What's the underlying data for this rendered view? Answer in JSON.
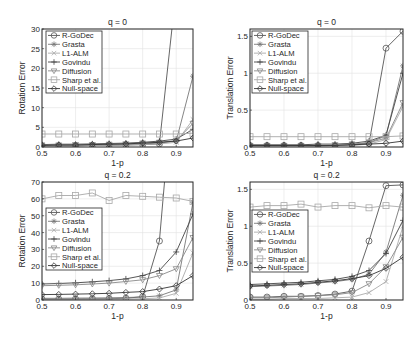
{
  "figure": {
    "width": 419,
    "height": 338,
    "colors": {
      "axis": "#262626",
      "grid": "#e3e3e3",
      "legend_border": "#262626"
    }
  },
  "legend_entries": [
    {
      "name": "R-GoDec",
      "marker": "circle",
      "color": "#555555"
    },
    {
      "name": "Grasta",
      "marker": "asterisk",
      "color": "#777777"
    },
    {
      "name": "L1-ALM",
      "marker": "x",
      "color": "#aaaaaa"
    },
    {
      "name": "Govindu",
      "marker": "plus",
      "color": "#444444"
    },
    {
      "name": "Diffusion",
      "marker": "triangle-down",
      "color": "#888888"
    },
    {
      "name": "Sharp et al.",
      "marker": "square",
      "color": "#a8a8a8"
    },
    {
      "name": "Null-space",
      "marker": "diamond",
      "color": "#333333"
    }
  ],
  "chart_data": [
    {
      "type": "line",
      "title": "q = 0",
      "xlabel": "1-p",
      "ylabel": "Rotation Error",
      "xlim": [
        0.5,
        0.95
      ],
      "ylim": [
        0,
        30
      ],
      "xticks": [
        0.5,
        0.6,
        0.7,
        0.8,
        0.9
      ],
      "yticks": [
        0,
        5,
        10,
        15,
        20,
        25,
        30
      ],
      "grid": true,
      "legend_position": "upper left",
      "box": {
        "x": 42,
        "y": 29,
        "w": 151,
        "h": 118
      },
      "legend_box": {
        "x": 46,
        "y": 31,
        "w": 56,
        "h": 62
      },
      "x": [
        0.5,
        0.55,
        0.6,
        0.65,
        0.7,
        0.75,
        0.8,
        0.85,
        0.9,
        0.95
      ],
      "series": [
        {
          "name": "R-GoDec",
          "values": [
            0.3,
            0.3,
            0.3,
            0.4,
            0.4,
            0.5,
            0.6,
            0.8,
            40,
            200
          ]
        },
        {
          "name": "Grasta",
          "values": [
            0.4,
            0.4,
            0.5,
            0.5,
            0.6,
            0.7,
            0.8,
            1.0,
            1.5,
            18
          ]
        },
        {
          "name": "L1-ALM",
          "values": [
            0.3,
            0.3,
            0.3,
            0.4,
            0.4,
            0.5,
            0.6,
            0.8,
            1.2,
            7
          ]
        },
        {
          "name": "Govindu",
          "values": [
            0.6,
            0.7,
            0.7,
            0.8,
            0.9,
            1.0,
            1.2,
            1.5,
            2.0,
            4.5
          ]
        },
        {
          "name": "Diffusion",
          "values": [
            0.5,
            0.5,
            0.6,
            0.6,
            0.7,
            0.8,
            1.0,
            1.2,
            1.6,
            6
          ]
        },
        {
          "name": "Sharp et al.",
          "values": [
            3.3,
            3.3,
            3.3,
            3.3,
            3.3,
            3.3,
            3.3,
            3.3,
            3.3,
            3.5
          ]
        },
        {
          "name": "Null-space",
          "values": [
            0.4,
            0.5,
            0.5,
            0.6,
            0.7,
            0.8,
            1.0,
            1.2,
            1.5,
            2.3
          ]
        }
      ]
    },
    {
      "type": "line",
      "title": "q = 0",
      "xlabel": "1-p",
      "ylabel": "Translation Error",
      "xlim": [
        0.5,
        0.95
      ],
      "ylim": [
        0,
        1.6
      ],
      "xticks": [
        0.5,
        0.6,
        0.7,
        0.8,
        0.9
      ],
      "yticks": [
        0,
        0.5,
        1,
        1.5
      ],
      "grid": true,
      "legend_position": "upper left",
      "box": {
        "x": 250,
        "y": 29,
        "w": 153,
        "h": 118
      },
      "legend_box": {
        "x": 252,
        "y": 31,
        "w": 56,
        "h": 62
      },
      "x": [
        0.5,
        0.55,
        0.6,
        0.65,
        0.7,
        0.75,
        0.8,
        0.85,
        0.9,
        0.95
      ],
      "series": [
        {
          "name": "R-GoDec",
          "values": [
            0.02,
            0.02,
            0.02,
            0.02,
            0.02,
            0.02,
            0.03,
            0.05,
            1.34,
            1.57
          ]
        },
        {
          "name": "Grasta",
          "values": [
            0.02,
            0.02,
            0.02,
            0.02,
            0.02,
            0.02,
            0.03,
            0.06,
            0.15,
            1.1
          ]
        },
        {
          "name": "L1-ALM",
          "values": [
            0.01,
            0.01,
            0.01,
            0.01,
            0.01,
            0.02,
            0.02,
            0.04,
            0.1,
            0.55
          ]
        },
        {
          "name": "Govindu",
          "values": [
            0.03,
            0.03,
            0.03,
            0.03,
            0.04,
            0.04,
            0.05,
            0.08,
            0.16,
            1.0
          ]
        },
        {
          "name": "Diffusion",
          "values": [
            0.02,
            0.02,
            0.02,
            0.02,
            0.02,
            0.03,
            0.04,
            0.06,
            0.12,
            0.6
          ]
        },
        {
          "name": "Sharp et al.",
          "values": [
            0.14,
            0.14,
            0.14,
            0.14,
            0.14,
            0.14,
            0.14,
            0.14,
            0.14,
            0.15
          ]
        },
        {
          "name": "Null-space",
          "values": [
            0.02,
            0.02,
            0.02,
            0.02,
            0.02,
            0.02,
            0.03,
            0.04,
            0.05,
            0.08
          ]
        }
      ]
    },
    {
      "type": "line",
      "title": "q = 0.2",
      "xlabel": "1-p",
      "ylabel": "Rotation Error",
      "xlim": [
        0.5,
        0.95
      ],
      "ylim": [
        0,
        70
      ],
      "xticks": [
        0.5,
        0.6,
        0.7,
        0.8,
        0.9
      ],
      "yticks": [
        0,
        10,
        20,
        30,
        40,
        50,
        60,
        70
      ],
      "grid": true,
      "legend_position": "center left",
      "box": {
        "x": 42,
        "y": 182,
        "w": 151,
        "h": 118
      },
      "legend_box": {
        "x": 46,
        "y": 208,
        "w": 56,
        "h": 62
      },
      "x": [
        0.5,
        0.55,
        0.6,
        0.65,
        0.7,
        0.75,
        0.8,
        0.85,
        0.9,
        0.95
      ],
      "series": [
        {
          "name": "R-GoDec",
          "values": [
            0.5,
            0.5,
            0.6,
            0.7,
            0.8,
            1.0,
            2.0,
            35,
            150,
            300
          ]
        },
        {
          "name": "Grasta",
          "values": [
            1.0,
            1.0,
            1.1,
            1.2,
            1.3,
            1.5,
            1.8,
            2.5,
            6,
            58
          ]
        },
        {
          "name": "L1-ALM",
          "values": [
            0.3,
            0.3,
            0.3,
            0.4,
            0.5,
            0.6,
            0.8,
            1.2,
            4,
            28
          ]
        },
        {
          "name": "Govindu",
          "values": [
            9.5,
            9.8,
            10.2,
            10.8,
            11.5,
            12.5,
            14.5,
            17.5,
            28.5,
            51
          ]
        },
        {
          "name": "Diffusion",
          "values": [
            8.5,
            8.7,
            9.0,
            9.5,
            10.0,
            11.0,
            12.0,
            14.5,
            18.5,
            37
          ]
        },
        {
          "name": "Sharp et al.",
          "values": [
            60,
            62,
            62,
            63.5,
            59,
            62,
            61.5,
            61,
            60.5,
            58.5
          ]
        },
        {
          "name": "Null-space",
          "values": [
            3.2,
            3.3,
            3.5,
            3.7,
            4.0,
            4.5,
            5.0,
            6.5,
            8.5,
            14.5
          ]
        }
      ]
    },
    {
      "type": "line",
      "title": "q = 0.2",
      "xlabel": "1-p",
      "ylabel": "Translation Error",
      "xlim": [
        0.5,
        0.95
      ],
      "ylim": [
        0,
        1.6
      ],
      "xticks": [
        0.5,
        0.6,
        0.7,
        0.8,
        0.9
      ],
      "yticks": [
        0,
        0.5,
        1,
        1.5
      ],
      "grid": true,
      "legend_position": "center left",
      "box": {
        "x": 250,
        "y": 182,
        "w": 153,
        "h": 118
      },
      "legend_box": {
        "x": 252,
        "y": 210,
        "w": 56,
        "h": 62
      },
      "x": [
        0.5,
        0.55,
        0.6,
        0.65,
        0.7,
        0.75,
        0.8,
        0.85,
        0.9,
        0.95
      ],
      "series": [
        {
          "name": "R-GoDec",
          "values": [
            0.04,
            0.04,
            0.05,
            0.05,
            0.06,
            0.08,
            0.12,
            0.8,
            1.55,
            1.56
          ]
        },
        {
          "name": "Grasta",
          "values": [
            0.18,
            0.19,
            0.2,
            0.21,
            0.23,
            0.25,
            0.28,
            0.35,
            0.65,
            1.42
          ]
        },
        {
          "name": "L1-ALM",
          "values": [
            0.01,
            0.01,
            0.02,
            0.02,
            0.02,
            0.03,
            0.04,
            0.1,
            0.25,
            1.0
          ]
        },
        {
          "name": "Govindu",
          "values": [
            0.21,
            0.22,
            0.23,
            0.24,
            0.26,
            0.28,
            0.32,
            0.4,
            0.63,
            1.08
          ]
        },
        {
          "name": "Diffusion",
          "values": [
            0.03,
            0.03,
            0.04,
            0.05,
            0.06,
            0.07,
            0.1,
            0.22,
            0.45,
            0.85
          ]
        },
        {
          "name": "Sharp et al.",
          "values": [
            1.26,
            1.28,
            1.28,
            1.3,
            1.26,
            1.28,
            1.28,
            1.25,
            1.28,
            1.26
          ]
        },
        {
          "name": "Null-space",
          "values": [
            0.19,
            0.2,
            0.21,
            0.22,
            0.24,
            0.26,
            0.29,
            0.33,
            0.43,
            0.58
          ]
        }
      ]
    }
  ]
}
